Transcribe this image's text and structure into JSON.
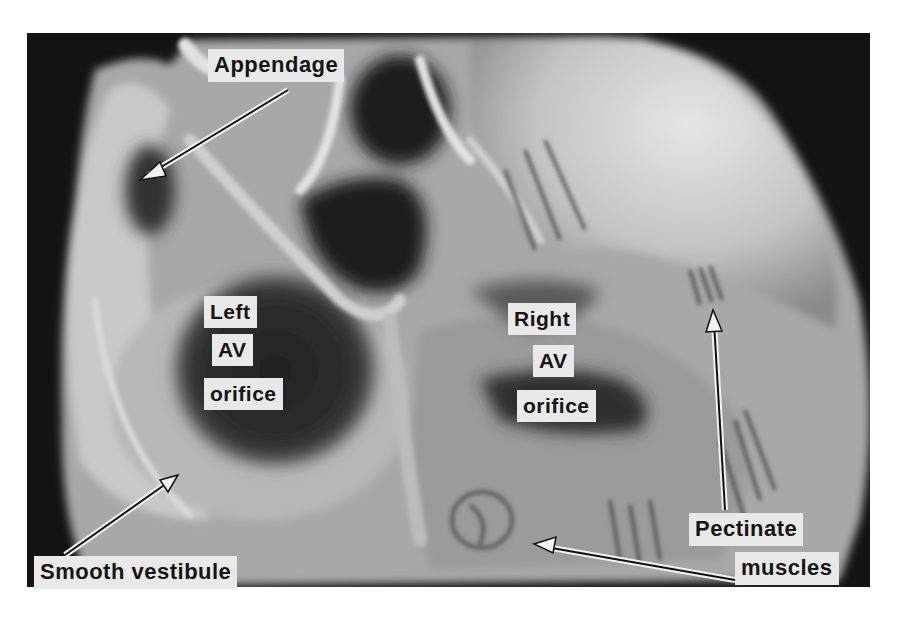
{
  "figure": {
    "style": "grayscale photograph with white label boxes and outlined arrows",
    "colors": {
      "background": "#ffffff",
      "photo_backdrop": "#131313",
      "tissue_light": "#d8d8d8",
      "tissue_mid": "#9a9a9a",
      "cavity_dark": "#2a2a2a",
      "label_box": "#e9e9e9",
      "label_text": "#151515"
    }
  },
  "labels": {
    "appendage": "Appendage",
    "left_av_line1": "Left",
    "left_av_line2": "AV",
    "left_av_line3": "orifice",
    "right_av_line1": "Right",
    "right_av_line2": "AV",
    "right_av_line3": "orifice",
    "smooth_vestibule": "Smooth vestibule",
    "pectinate_line1": "Pectinate",
    "pectinate_line2": "muscles"
  },
  "arrows": [
    {
      "name": "appendage-arrow",
      "from": [
        288,
        90
      ],
      "to": [
        140,
        180
      ]
    },
    {
      "name": "smooth-vestibule-arrow",
      "from": [
        65,
        555
      ],
      "to": [
        178,
        475
      ]
    },
    {
      "name": "pectinate-arrow-up",
      "from": [
        725,
        510
      ],
      "to": [
        713,
        312
      ]
    },
    {
      "name": "pectinate-arrow-left",
      "from": [
        735,
        580
      ],
      "to": [
        536,
        545
      ]
    }
  ]
}
